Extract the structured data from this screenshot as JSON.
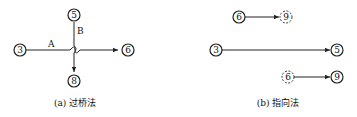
{
  "panel_a": {
    "caption": "(a) 过桥法",
    "nodes": {
      "n3": "3",
      "n5": "5",
      "n6": "6",
      "n8": "8"
    },
    "labels": {
      "A": "A",
      "B": "B"
    }
  },
  "panel_b": {
    "caption": "(b) 指向法",
    "nodes": {
      "top_from": "6",
      "top_to": "9",
      "mid_from": "3",
      "mid_to": "5",
      "bot_from": "6",
      "bot_to": "9"
    }
  },
  "colors": {
    "line": "#222222",
    "background": "#ffffff"
  }
}
